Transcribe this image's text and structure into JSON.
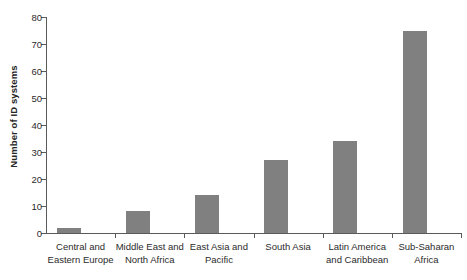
{
  "chart_data": {
    "type": "bar",
    "title": "",
    "xlabel": "",
    "ylabel": "Number of ID systems",
    "categories": [
      "Central and\nEastern Europe",
      "Middle East and\nNorth Africa",
      "East Asia and\nPacific",
      "South Asia",
      "Latin America\nand Caribbean",
      "Sub-Saharan\nAfrica"
    ],
    "category_lines": [
      [
        "Central and",
        "Eastern Europe"
      ],
      [
        "Middle East and",
        "North Africa"
      ],
      [
        "East Asia and",
        "Pacific"
      ],
      [
        "South Asia",
        ""
      ],
      [
        "Latin America",
        "and Caribbean"
      ],
      [
        "Sub-Saharan",
        "Africa"
      ]
    ],
    "values": [
      2,
      8,
      14,
      27,
      34,
      75
    ],
    "ylim": [
      0,
      80
    ],
    "ytick_step": 10,
    "yticks": [
      0,
      10,
      20,
      30,
      40,
      50,
      60,
      70,
      80
    ],
    "ytick_labels": [
      "0",
      "10",
      "20",
      "30",
      "40",
      "50",
      "60",
      "70",
      "80"
    ],
    "grid": false,
    "legend": null,
    "bar_color": "#808080",
    "axis_color": "#5a5a5a",
    "text_color": "#2b2b2b",
    "background": "#ffffff"
  }
}
